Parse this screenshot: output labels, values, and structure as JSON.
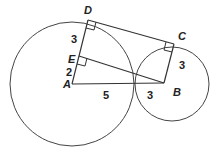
{
  "figure": {
    "points": {
      "A": "A",
      "B": "B",
      "C": "C",
      "D": "D",
      "E": "E"
    },
    "segment_labels": {
      "DE": "3",
      "EA": "2",
      "A_to_tangency": "5",
      "tangency_to_B": "3",
      "CB": "3"
    },
    "circles": [
      {
        "center": "A",
        "radius_units": 5
      },
      {
        "center": "B",
        "radius_units": 3
      }
    ],
    "right_angles": [
      "D",
      "E",
      "C"
    ],
    "stroke_color": "#444444"
  }
}
